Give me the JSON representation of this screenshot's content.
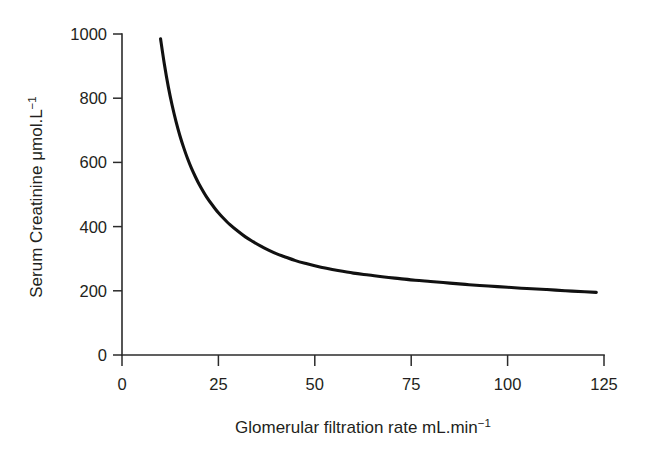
{
  "chart_data": {
    "type": "line",
    "title": "",
    "subtitle": "",
    "xlabel_main": "Glomerular filtration rate mL.min",
    "xlabel_exponent": "−1",
    "ylabel_main": "Serum Creatinine μmol.L",
    "ylabel_exponent": "−1",
    "xlabel": "Glomerular filtration rate mL.min⁻¹",
    "ylabel": "Serum Creatinine μmol.L⁻¹",
    "xlim": [
      0,
      125
    ],
    "ylim": [
      0,
      1000
    ],
    "xticks": [
      0,
      25,
      50,
      75,
      100,
      125
    ],
    "xtick_labels": [
      "0",
      "25",
      "50",
      "75",
      "100",
      "125"
    ],
    "yticks": [
      0,
      200,
      400,
      600,
      800,
      1000
    ],
    "ytick_labels": [
      "0",
      "200",
      "400",
      "600",
      "800",
      "1000"
    ],
    "grid": false,
    "legend": false,
    "legend_position": "none",
    "line_color": "#111111",
    "axis_color": "#2b2b2b",
    "background_color": "#ffffff",
    "annotations": [],
    "series": [
      {
        "name": "Serum creatinine vs GFR",
        "x": [
          10,
          11,
          12,
          13,
          14,
          15,
          16,
          17,
          18,
          19,
          20,
          22,
          24,
          25,
          26,
          28,
          30,
          32,
          34,
          36,
          38,
          40,
          42,
          45,
          48,
          50,
          53,
          56,
          60,
          64,
          68,
          72,
          76,
          80,
          85,
          90,
          95,
          100,
          105,
          110,
          115,
          120,
          123
        ],
        "y": [
          985,
          905,
          836,
          778,
          728,
          684,
          646,
          612,
          582,
          556,
          532,
          491,
          458,
          443,
          430,
          406,
          386,
          368,
          353,
          339,
          327,
          316,
          307,
          294,
          284,
          278,
          270,
          263,
          255,
          249,
          243,
          238,
          233,
          229,
          224,
          219,
          215,
          211,
          207,
          204,
          200,
          197,
          195
        ]
      }
    ],
    "curve_description": "Monotonic decreasing hyperbolic curve: serum creatinine falls steeply from ~985 μmol/L at GFR 10 mL/min, passes ~440 at GFR 25, ~280 at GFR 50, and flattens to an asymptote of ~110-125 μmol/L beyond GFR 75.",
    "asymptote_value": 110,
    "start_point": {
      "x": 10,
      "y": 985
    },
    "end_point": {
      "x": 123,
      "y": 110
    }
  },
  "figure": {
    "background": "#ffffff",
    "plot_left_px": 122,
    "plot_right_px": 604,
    "plot_baseline_px": 355,
    "plot_top_px": 34
  }
}
